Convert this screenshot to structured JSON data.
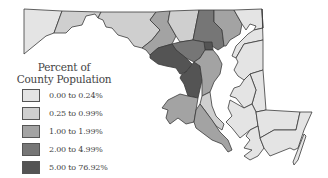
{
  "legend": {
    "title_line1": "Percent of",
    "title_line2": "County Population",
    "items": [
      {
        "label": "0.00 to 0.24%",
        "color": "#e4e4e4"
      },
      {
        "label": "0.25 to 0.99%",
        "color": "#cfcfcf"
      },
      {
        "label": "1.00 to 1.99%",
        "color": "#a3a3a3"
      },
      {
        "label": "2.00 to 4.99%",
        "color": "#767676"
      },
      {
        "label": "5.00 to 76.92%",
        "color": "#545454"
      }
    ]
  },
  "map": {
    "region": "Maryland",
    "counties": [
      {
        "name": "Garrett",
        "class": 0
      },
      {
        "name": "Allegany",
        "class": 1
      },
      {
        "name": "Washington",
        "class": 1
      },
      {
        "name": "Frederick",
        "class": 2
      },
      {
        "name": "Carroll",
        "class": 1
      },
      {
        "name": "Baltimore",
        "class": 3
      },
      {
        "name": "Baltimore City",
        "class": 4
      },
      {
        "name": "Harford",
        "class": 2
      },
      {
        "name": "Cecil",
        "class": 0
      },
      {
        "name": "Montgomery",
        "class": 4
      },
      {
        "name": "Howard",
        "class": 3
      },
      {
        "name": "Prince George's",
        "class": 4
      },
      {
        "name": "Anne Arundel",
        "class": 2
      },
      {
        "name": "Charles",
        "class": 2
      },
      {
        "name": "Calvert",
        "class": 1
      },
      {
        "name": "St. Mary's",
        "class": 2
      },
      {
        "name": "Kent",
        "class": 0
      },
      {
        "name": "Queen Anne's",
        "class": 0
      },
      {
        "name": "Talbot",
        "class": 0
      },
      {
        "name": "Caroline",
        "class": 0
      },
      {
        "name": "Dorchester",
        "class": 0
      },
      {
        "name": "Wicomico",
        "class": 0
      },
      {
        "name": "Somerset",
        "class": 0
      },
      {
        "name": "Worcester",
        "class": 0
      }
    ]
  }
}
